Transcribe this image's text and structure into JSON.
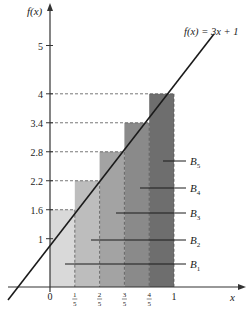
{
  "function_label": "f(x) = 3x + 1",
  "y_axis_label": "f(x)",
  "x_axis_label": "x",
  "y_ticks": [
    {
      "label": "1",
      "value": 1
    },
    {
      "label": "1.6",
      "value": 1.6
    },
    {
      "label": "2.2",
      "value": 2.2
    },
    {
      "label": "2.8",
      "value": 2.8
    },
    {
      "label": "3.4",
      "value": 3.4
    },
    {
      "label": "4",
      "value": 4
    },
    {
      "label": "5",
      "value": 5
    }
  ],
  "x_ticks": [
    {
      "label": "0",
      "num": "",
      "den": ""
    },
    {
      "label": "",
      "num": "1",
      "den": "5"
    },
    {
      "label": "",
      "num": "2",
      "den": "5"
    },
    {
      "label": "",
      "num": "3",
      "den": "5"
    },
    {
      "label": "",
      "num": "4",
      "den": "5"
    },
    {
      "label": "1",
      "num": "",
      "den": ""
    }
  ],
  "blocks": [
    {
      "name": "B",
      "sub": "1",
      "height": 1.6,
      "color": "#d9d9d9"
    },
    {
      "name": "B",
      "sub": "2",
      "height": 2.2,
      "color": "#bdbdbd"
    },
    {
      "name": "B",
      "sub": "3",
      "height": 2.8,
      "color": "#a3a3a3"
    },
    {
      "name": "B",
      "sub": "4",
      "height": 3.4,
      "color": "#8a8a8a"
    },
    {
      "name": "B",
      "sub": "5",
      "height": 4.0,
      "color": "#6e6e6e"
    }
  ],
  "colors": {
    "axis": "#333333",
    "line": "#1a1a1a",
    "dash": "#555555"
  }
}
